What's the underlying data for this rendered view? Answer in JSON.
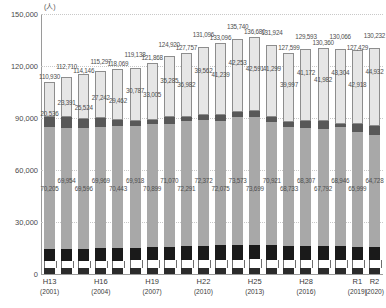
{
  "chart": {
    "unit_label": "(人)",
    "y_ticks": [
      "150,000",
      "120,000",
      "90,000",
      "60,000",
      "30,000",
      "0"
    ],
    "x_groups": [
      {
        "era": "H13",
        "year": "(2001)"
      },
      {
        "era": "H16",
        "year": "(2004)"
      },
      {
        "era": "H19",
        "year": "(2007)"
      },
      {
        "era": "H22",
        "year": "(2010)"
      },
      {
        "era": "H25",
        "year": "(2013)"
      },
      {
        "era": "H28",
        "year": "(2016)"
      },
      {
        "era": "R1",
        "year": "(2019)"
      },
      {
        "era": "R2",
        "year": "(2020)"
      }
    ]
  },
  "chart_data": {
    "type": "bar",
    "title": "",
    "subtitle": "",
    "xlabel": "",
    "ylabel": "(人)",
    "ylim": [
      0,
      150000
    ],
    "y_ticks": [
      0,
      30000,
      60000,
      90000,
      120000,
      150000
    ],
    "grid": true,
    "legend": "none",
    "stacked": true,
    "categories": [
      "H13 (2001)",
      "H14 (2002)",
      "H15 (2003)",
      "H16 (2004)",
      "H17 (2005)",
      "H18 (2006)",
      "H19 (2007)",
      "H20 (2008)",
      "H21 (2009)",
      "H22 (2010)",
      "H23 (2011)",
      "H24 (2012)",
      "H25 (2013)",
      "H26 (2014)",
      "H27 (2015)",
      "H28 (2016)",
      "H29 (2017)",
      "H30 (2018)",
      "R1 (2019)",
      "R2 (2020)"
    ],
    "totals": [
      110930,
      112710,
      114146,
      115297,
      118069,
      119138,
      121868,
      124920,
      127757,
      131096,
      133096,
      135740,
      136680,
      131924,
      127599,
      129593,
      130360,
      130066,
      127429,
      130232
    ],
    "top_segment_labels": [
      20536,
      23391,
      25524,
      27242,
      29462,
      30787,
      33005,
      35285,
      36982,
      39562,
      41239,
      42253,
      42591,
      41299,
      39997,
      41172,
      41982,
      43304,
      42918,
      44932
    ],
    "middle_segment_labels": [
      70205,
      69954,
      69596,
      69969,
      70443,
      69918,
      70899,
      71070,
      72291,
      72372,
      72075,
      73573,
      73699,
      70921,
      68733,
      68307,
      67792,
      68946,
      65999,
      64728
    ],
    "series": [
      {
        "name": "bottom-dark",
        "values": [
          3300,
          3320,
          3340,
          3360,
          3380,
          3400,
          3420,
          3450,
          3480,
          3500,
          3520,
          3560,
          3580,
          3540,
          3480,
          3460,
          3440,
          3460,
          3400,
          3380
        ]
      },
      {
        "name": "white-band",
        "values": [
          4200,
          4240,
          4280,
          4320,
          4380,
          4420,
          4460,
          4520,
          4580,
          4640,
          4700,
          4760,
          4800,
          4720,
          4620,
          4580,
          4560,
          4600,
          4520,
          4480
        ]
      },
      {
        "name": "black-band",
        "values": [
          6900,
          7000,
          7100,
          7200,
          7350,
          7450,
          7600,
          7750,
          7900,
          8100,
          8250,
          8450,
          8550,
          8350,
          8100,
          8050,
          7980,
          8100,
          7900,
          7800
        ]
      },
      {
        "name": "grey-main",
        "values": [
          70205,
          69954,
          69596,
          69969,
          70443,
          69918,
          70899,
          71070,
          72291,
          72372,
          72075,
          73573,
          73699,
          70921,
          68733,
          68307,
          67792,
          68946,
          65999,
          64728
        ]
      },
      {
        "name": "dark-grey",
        "values": [
          5789,
          5805,
          5306,
          5206,
          3056,
          3163,
          2484,
          3845,
          2524,
          2922,
          3312,
          3148,
          3460,
          3094,
          2669,
          4024,
          4606,
          1656,
          4692,
          4912
        ]
      },
      {
        "name": "light-top",
        "values": [
          20536,
          23391,
          25524,
          27242,
          29462,
          30787,
          33005,
          35285,
          36982,
          39562,
          41239,
          42253,
          42591,
          41299,
          39997,
          41172,
          41982,
          43304,
          42918,
          44932
        ]
      }
    ]
  }
}
